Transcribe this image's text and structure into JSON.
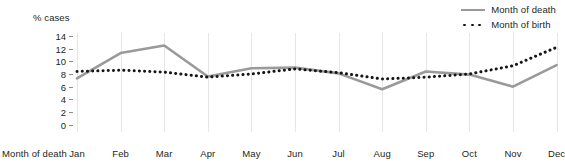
{
  "chart_data": {
    "type": "line",
    "title": "",
    "ylabel": "% cases",
    "xlabel": "Month of death",
    "xlabel_prefix": "Month of death",
    "categories": [
      "Jan",
      "Feb",
      "Mar",
      "Apr",
      "May",
      "Jun",
      "Jul",
      "Aug",
      "Sep",
      "Oct",
      "Nov",
      "Dec"
    ],
    "ylim": [
      0,
      14
    ],
    "yticks": [
      0,
      2,
      4,
      6,
      8,
      10,
      12,
      14
    ],
    "ytick_labels": [
      "0",
      "2",
      "4",
      "6",
      "8",
      "10",
      "12",
      "14"
    ],
    "grid": "vertical",
    "legend_position": "top-right",
    "series": [
      {
        "name": "Month of death",
        "style": "solid",
        "color": "#9a9a9a",
        "values": [
          7.3,
          11.3,
          12.5,
          7.6,
          8.9,
          9.0,
          8.1,
          5.6,
          8.4,
          7.9,
          6.0,
          9.4
        ]
      },
      {
        "name": "Month of birth",
        "style": "dotted",
        "color": "#151515",
        "values": [
          8.4,
          8.6,
          8.3,
          7.5,
          8.0,
          8.8,
          8.2,
          7.2,
          7.5,
          8.0,
          9.3,
          12.2
        ]
      }
    ]
  },
  "legend": {
    "items": [
      {
        "label": "Month of death",
        "marker": "solid-line-swatch"
      },
      {
        "label": "Month of birth",
        "marker": "dotted-line-swatch"
      }
    ]
  },
  "colors": {
    "death_line": "#9a9a9a",
    "birth_line": "#151515",
    "gridline": "#e6e6e6",
    "text": "#231f20",
    "background": "#ffffff"
  }
}
